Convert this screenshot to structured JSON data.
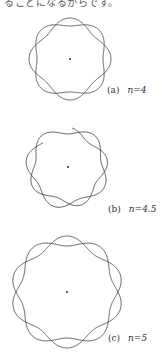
{
  "page": {
    "top_text": "ることになるからです。"
  },
  "figures": [
    {
      "id": "a",
      "label": "(a)",
      "n_text": "n=4",
      "n": 4,
      "center": [
        70,
        59
      ],
      "radius": 37,
      "amplitude": 4,
      "phase_deg": 90,
      "label_pos": [
        107,
        85
      ]
    },
    {
      "id": "b",
      "label": "(b)",
      "n_text": "n=4.5",
      "n": 4.5,
      "center": [
        68,
        167
      ],
      "radius": 37,
      "amplitude": 4,
      "phase_deg": 90,
      "label_pos": [
        108,
        204
      ]
    },
    {
      "id": "c",
      "label": "(c)",
      "n_text": "n=5",
      "n": 5,
      "center": [
        67,
        292
      ],
      "radius": 51,
      "amplitude": 5,
      "phase_deg": 90,
      "label_pos": [
        108,
        333
      ]
    }
  ],
  "colors": {
    "line": "#333333",
    "text": "#333333",
    "background": "#ffffff"
  }
}
